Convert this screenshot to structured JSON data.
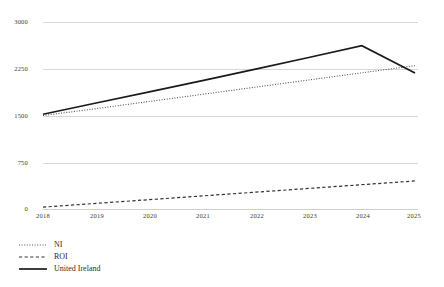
{
  "chart_data": {
    "type": "line",
    "title": "",
    "xlabel": "",
    "ylabel": "",
    "categories": [
      "2018",
      "2019",
      "2020",
      "2021",
      "2022",
      "2023",
      "2024",
      "2025"
    ],
    "x": [
      2018,
      2019,
      2020,
      2021,
      2022,
      2023,
      2024,
      2025
    ],
    "ylim": [
      0,
      3000
    ],
    "xlim": [
      2018,
      2025
    ],
    "yticks": [
      0,
      750,
      1500,
      2250,
      3000
    ],
    "ytick_labels": [
      "0",
      "750",
      "1500",
      "2250",
      "3000"
    ],
    "grid": "horizontal",
    "legend_position": "bottom-left",
    "series": [
      {
        "name": "NI",
        "style": "dotted",
        "color": "#555555",
        "values": [
          1500,
          1610,
          1725,
          1840,
          1955,
          2070,
          2185,
          2300
        ]
      },
      {
        "name": "ROI",
        "style": "dashed",
        "color": "#333333",
        "values": [
          30,
          90,
          150,
          210,
          270,
          330,
          390,
          450
        ]
      },
      {
        "name": "United Ireland",
        "style": "solid",
        "color": "#1a1a1a",
        "values": [
          1520,
          1700,
          1880,
          2060,
          2245,
          2430,
          2620,
          2180
        ]
      }
    ]
  },
  "axes": {
    "ytick_labels": [
      "3000",
      "2250",
      "1500",
      "750",
      "0"
    ],
    "xtick_labels": [
      "2018",
      "2019",
      "2020",
      "2021",
      "2022",
      "2023",
      "2024",
      "2025"
    ]
  },
  "legend": {
    "items": [
      {
        "label": "NI",
        "style": "dotted"
      },
      {
        "label": "ROI",
        "style": "dashed"
      },
      {
        "label": "United Ireland",
        "style": "solid"
      }
    ]
  },
  "colors": {
    "gridline": "#d8d8d8",
    "text": "#3c3c3c",
    "series_ni": "#555555",
    "series_roi": "#333333",
    "series_ui": "#1a1a1a",
    "background": "#ffffff"
  }
}
